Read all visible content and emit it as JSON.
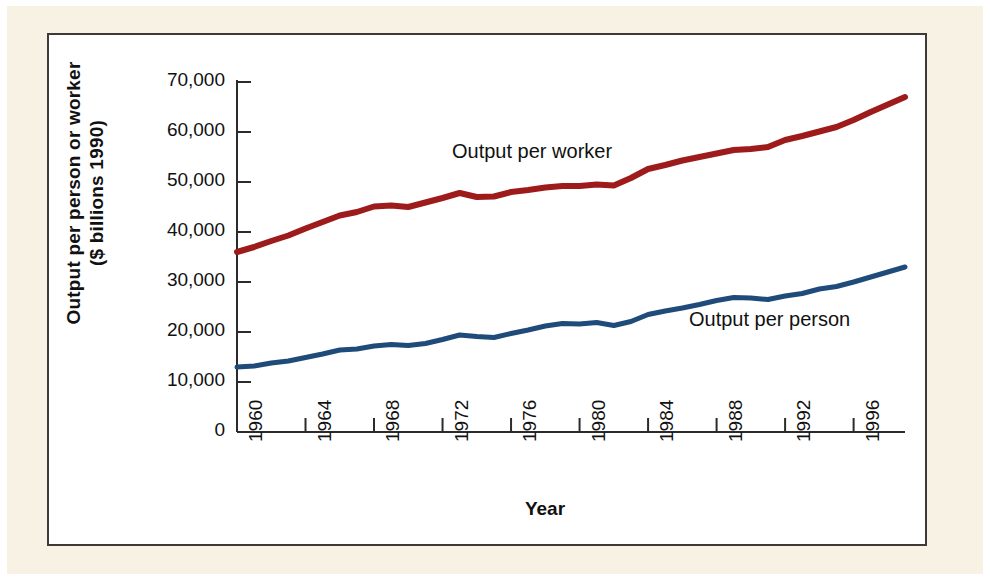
{
  "figure": {
    "frame_color": "#3d3a38",
    "mat_color": "#f7f2e4",
    "plot_background": "#ffffff"
  },
  "chart_data": {
    "type": "line",
    "title": "",
    "xlabel": "Year",
    "ylabel": "Output per person or worker ($ billions 1990)",
    "ylabel_line1": "Output per person or worker",
    "ylabel_line2": "($ billions 1990)",
    "xlim": [
      1960,
      1999
    ],
    "ylim": [
      0,
      70000
    ],
    "grid": false,
    "legend_position": "inline-annotation",
    "y_ticks": [
      0,
      10000,
      20000,
      30000,
      40000,
      50000,
      60000,
      70000
    ],
    "y_tick_labels": [
      "0",
      "10,000",
      "20,000",
      "30,000",
      "40,000",
      "50,000",
      "60,000",
      "70,000"
    ],
    "x_ticks": [
      1960,
      1964,
      1968,
      1972,
      1976,
      1980,
      1984,
      1988,
      1992,
      1996
    ],
    "x_tick_labels": [
      "1960",
      "1964",
      "1968",
      "1972",
      "1976",
      "1980",
      "1984",
      "1988",
      "1992",
      "1996"
    ],
    "x": [
      1960,
      1961,
      1962,
      1963,
      1964,
      1965,
      1966,
      1967,
      1968,
      1969,
      1970,
      1971,
      1972,
      1973,
      1974,
      1975,
      1976,
      1977,
      1978,
      1979,
      1980,
      1981,
      1982,
      1983,
      1984,
      1985,
      1986,
      1987,
      1988,
      1989,
      1990,
      1991,
      1992,
      1993,
      1994,
      1995,
      1996,
      1997,
      1998,
      1999
    ],
    "series": [
      {
        "name": "Output per worker",
        "color": "#9E1B1B",
        "label_text": "Output per worker",
        "values": [
          36000,
          37000,
          38200,
          39300,
          40700,
          42000,
          43300,
          44000,
          45100,
          45300,
          45000,
          45900,
          46800,
          47800,
          47000,
          47100,
          48000,
          48400,
          48900,
          49200,
          49200,
          49500,
          49300,
          50800,
          52600,
          53400,
          54300,
          55000,
          55700,
          56400,
          56600,
          57000,
          58400,
          59200,
          60100,
          61000,
          62400,
          64000,
          65500,
          67000
        ]
      },
      {
        "name": "Output per person",
        "color": "#1E4B7A",
        "label_text": "Output per person",
        "values": [
          13000,
          13200,
          13800,
          14200,
          14900,
          15600,
          16400,
          16600,
          17200,
          17500,
          17300,
          17700,
          18500,
          19400,
          19100,
          18900,
          19700,
          20400,
          21200,
          21700,
          21600,
          21900,
          21300,
          22100,
          23500,
          24200,
          24800,
          25500,
          26300,
          26900,
          26800,
          26500,
          27200,
          27700,
          28600,
          29100,
          30000,
          31000,
          32000,
          33000
        ]
      }
    ]
  }
}
